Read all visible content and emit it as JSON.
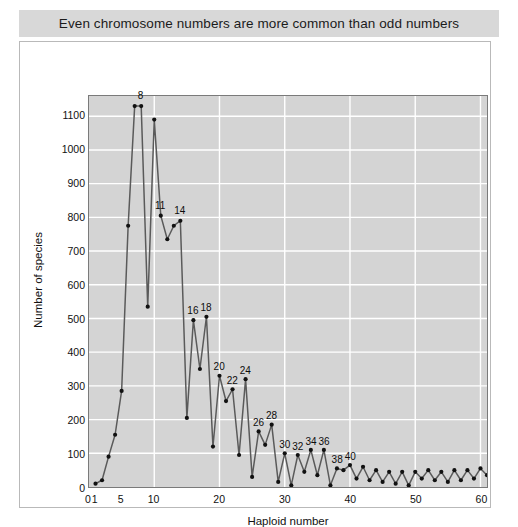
{
  "title": "Even chromosome numbers are more common than odd numbers",
  "axis": {
    "x_title": "Haploid number",
    "y_title": "Number of species"
  },
  "colors": {
    "banner_background": "#d8d8d8",
    "plot_background": "#d4d4d4",
    "gridline": "#ffffff",
    "line": "#5a5a5a",
    "marker": "#111111",
    "frame": "#b9b9b9",
    "text": "#111111"
  },
  "chart_data": {
    "type": "line",
    "title": "Even chromosome numbers are more common than odd numbers",
    "xlabel": "Haploid number",
    "ylabel": "Number of species",
    "xlim": [
      0,
      61
    ],
    "ylim": [
      0,
      1160
    ],
    "grid": true,
    "legend": null,
    "xticks": [
      0,
      1,
      5,
      10,
      20,
      30,
      40,
      50,
      60
    ],
    "yticks": [
      0,
      100,
      200,
      300,
      400,
      500,
      600,
      700,
      800,
      900,
      1000,
      1100
    ],
    "x": [
      1,
      2,
      3,
      4,
      5,
      6,
      7,
      8,
      9,
      10,
      11,
      12,
      13,
      14,
      15,
      16,
      17,
      18,
      19,
      20,
      21,
      22,
      23,
      24,
      25,
      26,
      27,
      28,
      29,
      30,
      31,
      32,
      33,
      34,
      35,
      36,
      37,
      38,
      39,
      40,
      41,
      42,
      43,
      44,
      45,
      46,
      47,
      48,
      49,
      50,
      51,
      52,
      53,
      54,
      55,
      56,
      57,
      58,
      59,
      60,
      61
    ],
    "values": [
      10,
      20,
      90,
      155,
      285,
      775,
      1130,
      1130,
      535,
      1090,
      805,
      735,
      775,
      790,
      205,
      495,
      350,
      505,
      120,
      330,
      255,
      290,
      95,
      320,
      30,
      165,
      125,
      185,
      15,
      100,
      5,
      95,
      45,
      110,
      35,
      110,
      5,
      55,
      50,
      65,
      25,
      60,
      20,
      50,
      15,
      45,
      10,
      45,
      5,
      45,
      25,
      50,
      20,
      45,
      15,
      50,
      20,
      50,
      25,
      55,
      35
    ],
    "annotations": [
      {
        "x": 8,
        "label": "8"
      },
      {
        "x": 11,
        "label": "11"
      },
      {
        "x": 14,
        "label": "14"
      },
      {
        "x": 16,
        "label": "16"
      },
      {
        "x": 18,
        "label": "18"
      },
      {
        "x": 20,
        "label": "20"
      },
      {
        "x": 22,
        "label": "22"
      },
      {
        "x": 24,
        "label": "24"
      },
      {
        "x": 26,
        "label": "26"
      },
      {
        "x": 28,
        "label": "28"
      },
      {
        "x": 30,
        "label": "30"
      },
      {
        "x": 32,
        "label": "32"
      },
      {
        "x": 34,
        "label": "34"
      },
      {
        "x": 36,
        "label": "36"
      },
      {
        "x": 38,
        "label": "38"
      },
      {
        "x": 40,
        "label": "40"
      }
    ]
  }
}
